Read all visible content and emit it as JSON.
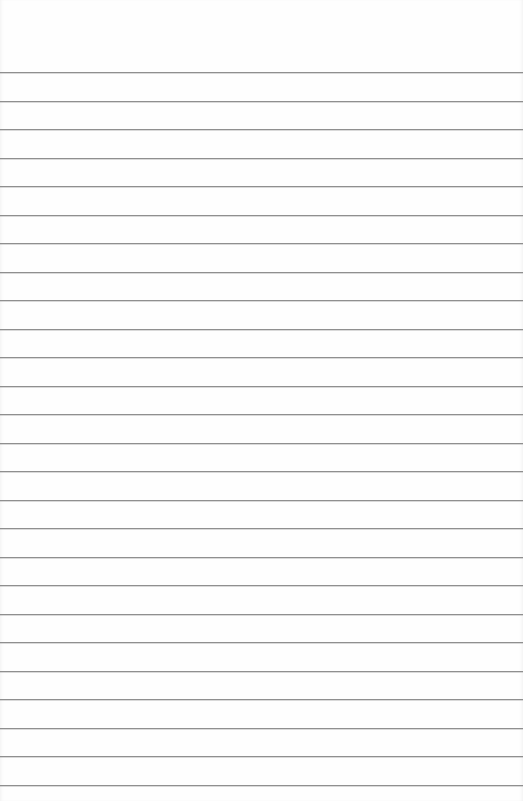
{
  "paper": {
    "type": "lined-paper",
    "background_color": "#fefefe",
    "line_color": "#8f8f8f",
    "first_line_y": 72,
    "line_spacing": 28.5,
    "line_count": 26
  }
}
